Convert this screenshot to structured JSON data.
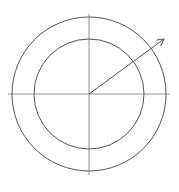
{
  "diagram": {
    "type": "concentric-circles-with-vector",
    "center": {
      "x": 89,
      "y": 94
    },
    "outer_circle": {
      "radius": 77
    },
    "inner_circle": {
      "radius": 55
    },
    "axes": {
      "horizontal": {
        "x1": 8,
        "x2": 170,
        "y": 94
      },
      "vertical": {
        "y1": 14,
        "y2": 175,
        "x": 89
      }
    },
    "arrow": {
      "x1": 89,
      "y1": 94,
      "x2": 164,
      "y2": 39
    },
    "colors": {
      "stroke": "#555555",
      "background": "#ffffff"
    }
  }
}
